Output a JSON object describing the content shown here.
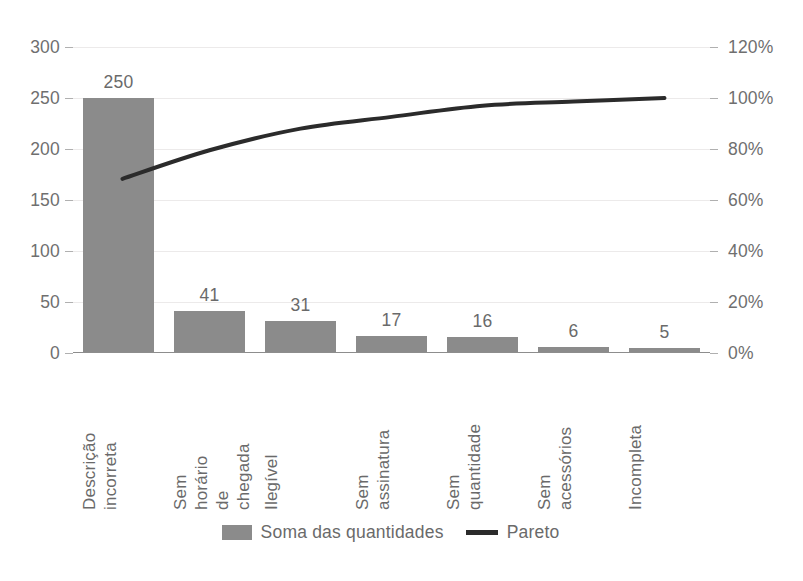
{
  "chart_data": {
    "type": "bar",
    "title": "",
    "categories": [
      "Descrição incorreta",
      "Sem horário de chegada",
      "Ilegível",
      "Sem assinatura",
      "Sem quantidade",
      "Sem acessórios",
      "Incompleta"
    ],
    "category_lines": [
      [
        "Descrição",
        "incorreta"
      ],
      [
        "Sem",
        "horário",
        "de",
        "chegada"
      ],
      [
        "Ilegível"
      ],
      [
        "Sem",
        "assinatura"
      ],
      [
        "Sem",
        "quantidade"
      ],
      [
        "Sem",
        "acessórios"
      ],
      [
        "Incompleta"
      ]
    ],
    "series": [
      {
        "name": "Soma das quantidades",
        "type": "bar",
        "axis": "left",
        "values": [
          250,
          41,
          31,
          17,
          16,
          6,
          5
        ],
        "color": "#8b8b8b"
      },
      {
        "name": "Pareto",
        "type": "line",
        "axis": "right",
        "values": [
          68.3,
          79.5,
          88.0,
          92.6,
          97.0,
          98.6,
          100.0
        ],
        "color": "#2b2b2b"
      }
    ],
    "total": 366,
    "xlabel": "",
    "ylabel": "",
    "y_left": {
      "min": 0,
      "max": 300,
      "step": 50,
      "ticks": [
        "0",
        "50",
        "100",
        "150",
        "200",
        "250",
        "300"
      ],
      "tick_values": [
        0,
        50,
        100,
        150,
        200,
        250,
        300
      ]
    },
    "y_right": {
      "min": 0,
      "max": 120,
      "step": 20,
      "ticks": [
        "0%",
        "20%",
        "40%",
        "60%",
        "80%",
        "100%",
        "120%"
      ],
      "tick_values": [
        0,
        20,
        40,
        60,
        80,
        100,
        120
      ]
    },
    "data_labels": [
      "250",
      "41",
      "31",
      "17",
      "16",
      "6",
      "5"
    ],
    "grid": true,
    "legend_position": "bottom"
  },
  "legend": {
    "bars_label": "Soma das quantidades",
    "line_label": "Pareto"
  },
  "colors": {
    "bar": "#8b8b8b",
    "line": "#2b2b2b",
    "grid": "#eceaea",
    "axis": "#8d8d8d",
    "text": "#6a6a6a"
  }
}
